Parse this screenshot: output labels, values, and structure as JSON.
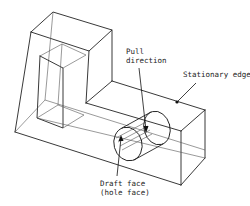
{
  "diagram": {
    "type": "isometric wireframe of a stepped block with a cylindrical hole",
    "labels": {
      "pull_direction_line1": "Pull",
      "pull_direction_line2": "direction",
      "stationary_edge": "Stationary edge",
      "draft_face_line1": "Draft face",
      "draft_face_line2": "(hole face)"
    },
    "colors": {
      "line": "#222222",
      "background": "#ffffff"
    }
  }
}
